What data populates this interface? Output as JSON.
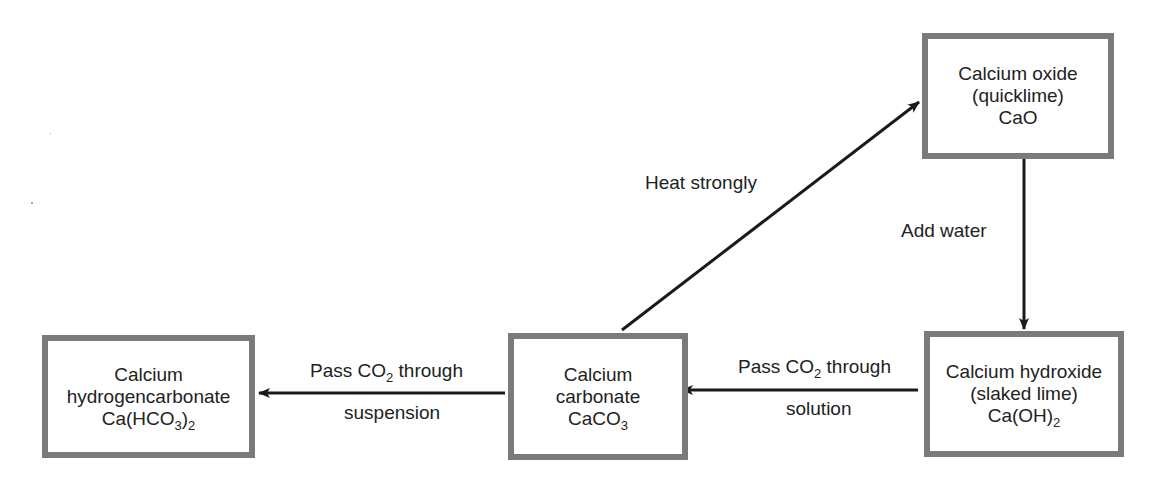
{
  "diagram": {
    "type": "flow",
    "title": "",
    "nodes": [
      {
        "id": "cao",
        "name": "Calcium oxide",
        "common_name": "(quicklime)",
        "formula": "CaO",
        "formula_main": "CaO",
        "formula_sub": "",
        "formula_tail": ""
      },
      {
        "id": "caoh2",
        "name": "Calcium hydroxide",
        "common_name": "(slaked lime)",
        "formula": "Ca(OH)2",
        "formula_main": "Ca(OH)",
        "formula_sub": "2",
        "formula_tail": ""
      },
      {
        "id": "caco3",
        "name_line1": "Calcium",
        "name_line2": "carbonate",
        "formula": "CaCO3",
        "formula_main": "CaCO",
        "formula_sub": "3",
        "formula_tail": ""
      },
      {
        "id": "cahco32",
        "name_line1": "Calcium",
        "name_line2": "hydrogencarbonate",
        "formula": "Ca(HCO3)2",
        "formula_main": "Ca(HCO",
        "formula_sub": "3",
        "formula_tail": ")",
        "formula_sub2": "2"
      }
    ],
    "edges": [
      {
        "from": "caco3",
        "to": "cao",
        "label": "Heat strongly"
      },
      {
        "from": "cao",
        "to": "caoh2",
        "label": "Add water"
      },
      {
        "from": "caoh2",
        "to": "caco3",
        "label_top_main": "Pass CO",
        "label_top_sub": "2",
        "label_top_tail": " through",
        "label_bottom": "solution",
        "label": "Pass CO2 through solution"
      },
      {
        "from": "caco3",
        "to": "cahco32",
        "label_top_main": "Pass CO",
        "label_top_sub": "2",
        "label_top_tail": " through",
        "label_bottom": "suspension",
        "label": "Pass CO2 through suspension"
      }
    ]
  },
  "colors": {
    "box_border": "#7a7a7a",
    "arrow": "#1a1a1a",
    "text": "#222222",
    "background": "#ffffff"
  }
}
